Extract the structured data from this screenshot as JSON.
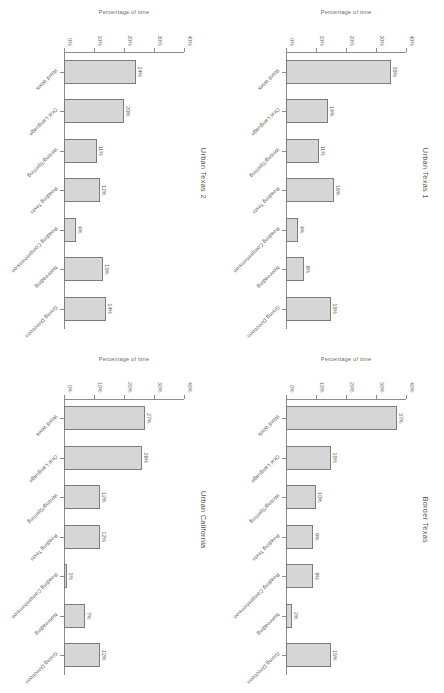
{
  "figure": {
    "axis_title": "Percentage of time",
    "categories": [
      "Word Work",
      "Oral Language",
      "Writing/Spelling",
      "Reading Texts",
      "Reading Comprehension",
      "Nonreading",
      "Giving Directions"
    ]
  },
  "chart_data": [
    {
      "type": "bar",
      "title": "Urban Texas 1",
      "categories": [
        "Word Work",
        "Oral Language",
        "Writing/Spelling",
        "Reading Texts",
        "Reading Comprehension",
        "Nonreading",
        "Giving Directions"
      ],
      "values": [
        35,
        14,
        11,
        16,
        4,
        6,
        15
      ],
      "value_labels": [
        "35%",
        "14%",
        "11%",
        "16%",
        "4%",
        "6%",
        "15%"
      ],
      "xlabel": "",
      "ylabel": "Percentage of time",
      "ylim": [
        0,
        40
      ],
      "yticks": [
        0,
        10,
        20,
        30,
        40
      ],
      "ytick_labels": [
        "0%",
        "10%",
        "20%",
        "30%",
        "40%"
      ],
      "grid": false,
      "legend": "none"
    },
    {
      "type": "bar",
      "title": "Border Texas",
      "categories": [
        "Word Work",
        "Oral Language",
        "Writing/Spelling",
        "Reading Texts",
        "Reading Comprehension",
        "Nonreading",
        "Giving Directions"
      ],
      "values": [
        37,
        15,
        10,
        9,
        9,
        2,
        15
      ],
      "value_labels": [
        "37%",
        "15%",
        "10%",
        "9%",
        "9%",
        "2%",
        "15%"
      ],
      "xlabel": "",
      "ylabel": "Percentage of time",
      "ylim": [
        0,
        40
      ],
      "yticks": [
        0,
        10,
        20,
        30,
        40
      ],
      "ytick_labels": [
        "0%",
        "10%",
        "20%",
        "30%",
        "40%"
      ],
      "grid": false,
      "legend": "none"
    },
    {
      "type": "bar",
      "title": "Urban Texas 2",
      "categories": [
        "Word Work",
        "Oral Language",
        "Writing/Spelling",
        "Reading Texts",
        "Reading Comprehension",
        "Nonreading",
        "Giving Directions"
      ],
      "values": [
        24,
        20,
        11,
        12,
        4,
        13,
        14
      ],
      "value_labels": [
        "24%",
        "20%",
        "11%",
        "12%",
        "4%",
        "13%",
        "14%"
      ],
      "xlabel": "",
      "ylabel": "Percentage of time",
      "ylim": [
        0,
        40
      ],
      "yticks": [
        0,
        10,
        20,
        30,
        40
      ],
      "ytick_labels": [
        "0%",
        "10%",
        "20%",
        "30%",
        "40%"
      ],
      "grid": false,
      "legend": "none"
    },
    {
      "type": "bar",
      "title": "Urban California",
      "categories": [
        "Word Work",
        "Oral Language",
        "Writing/Spelling",
        "Reading Texts",
        "Reading Comprehension",
        "Nonreading",
        "Giving Directions"
      ],
      "values": [
        27,
        26,
        12,
        12,
        1,
        7,
        12
      ],
      "value_labels": [
        "27%",
        "26%",
        "12%",
        "12%",
        "1%",
        "7%",
        "12%"
      ],
      "xlabel": "",
      "ylabel": "Percentage of time",
      "ylim": [
        0,
        40
      ],
      "yticks": [
        0,
        10,
        20,
        30,
        40
      ],
      "ytick_labels": [
        "0%",
        "10%",
        "20%",
        "30%",
        "40%"
      ],
      "grid": false,
      "legend": "none"
    }
  ],
  "style": {
    "bar_fill": "#d6d6d6",
    "bar_stroke": "#7d7d7d",
    "axis_color": "#8c8c8c",
    "text_color": "#5a5a5a",
    "background": "#ffffff"
  }
}
